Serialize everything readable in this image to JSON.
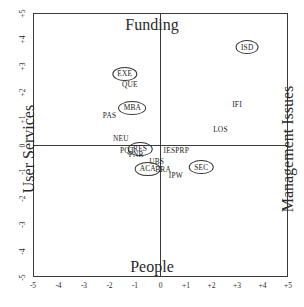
{
  "chart_data": {
    "type": "scatter",
    "title": "",
    "axis_titles": {
      "top": "Funding",
      "bottom": "People",
      "left": "User Services",
      "right": "Management Issues"
    },
    "xlabel": "People",
    "ylabel": "User Services",
    "xlim": [
      -5,
      5
    ],
    "ylim": [
      -5,
      5
    ],
    "grid": false,
    "legend": "none",
    "xticks": [
      "-5",
      "-4",
      "-3",
      "-2",
      "-1",
      "0",
      "+1",
      "+2",
      "+3",
      "+4",
      "+5"
    ],
    "yticks": [
      "+5",
      "+4",
      "+3",
      "+2",
      "+1",
      "0",
      "-1",
      "-2",
      "-3",
      "-4",
      "-5"
    ],
    "points": [
      {
        "label": "ISD",
        "x": 3.4,
        "y": 3.7,
        "circled": true
      },
      {
        "label": "EXE",
        "x": -1.4,
        "y": 2.7,
        "circled": true
      },
      {
        "label": "QUE",
        "x": -1.2,
        "y": 2.3,
        "circled": false
      },
      {
        "label": "MBA",
        "x": -1.1,
        "y": 1.4,
        "circled": true
      },
      {
        "label": "PAS",
        "x": -2.0,
        "y": 1.15,
        "circled": false
      },
      {
        "label": "IFI",
        "x": 3.0,
        "y": 1.55,
        "circled": false
      },
      {
        "label": "LOS",
        "x": 2.35,
        "y": 0.6,
        "circled": false
      },
      {
        "label": "NEU",
        "x": -1.55,
        "y": 0.25,
        "circled": false
      },
      {
        "label": "PQT",
        "x": -1.3,
        "y": -0.2,
        "circled": false
      },
      {
        "label": "RES",
        "x": -0.8,
        "y": -0.15,
        "circled": true
      },
      {
        "label": "PNR",
        "x": -0.95,
        "y": -0.35,
        "circled": false
      },
      {
        "label": "IES",
        "x": 0.35,
        "y": -0.2,
        "circled": false
      },
      {
        "label": "PRP",
        "x": 0.85,
        "y": -0.2,
        "circled": false
      },
      {
        "label": "UBS",
        "x": -0.15,
        "y": -0.6,
        "circled": false
      },
      {
        "label": "ACA",
        "x": -0.5,
        "y": -0.9,
        "circled": true
      },
      {
        "label": "BRA",
        "x": 0.1,
        "y": -0.9,
        "circled": false
      },
      {
        "label": "IPW",
        "x": 0.6,
        "y": -1.15,
        "circled": false
      },
      {
        "label": "SEC",
        "x": 1.6,
        "y": -0.85,
        "circled": true
      }
    ]
  }
}
